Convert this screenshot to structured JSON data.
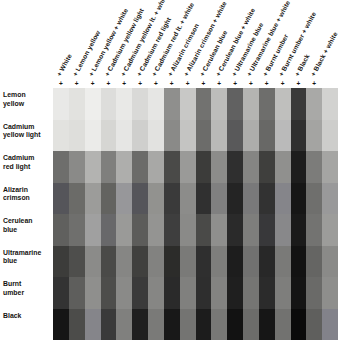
{
  "chart_data": {
    "type": "heatmap",
    "title": "",
    "xlabel": "",
    "ylabel": "",
    "grid": false,
    "legend": "none",
    "columns": [
      "+ White",
      "+ Lemon yellow",
      "+ Lemon yellow + white",
      "+ Cadmium yellow light",
      "+ Cadmium yellow lt. + white",
      "+ Cadmium red light",
      "+ Cadmium red lt. + white",
      "+ Alizarin crimson",
      "+ Alizarin crimson + white",
      "+ Cerulean blue",
      "+ Cerulean blue + white",
      "+ Ultramarine blue",
      "+ Ultramarine blue + white",
      "+ Burnt umber",
      "+ Burnt umber + white",
      "+ Black",
      "+ Black + white"
    ],
    "column_headers_full": [
      "+ White",
      "+ Lemon yellow",
      "+ Lemon yellow + white",
      "+ Cadmium yellow light",
      "+ Cadmium yellow lt. + white",
      "+ Cadmium red light",
      "+ Cadmium red lt. + white",
      "+ Alizarin crimson",
      "+ Alizarin crimson + white",
      "+ Cerulean blue",
      "+ Cerulean blue + white",
      "+ Ultramarine blue",
      "+ Ultramarine blue + white",
      "+ Burnt umber",
      "+ Burnt umber + white",
      "+ Black",
      "+ Black + white"
    ],
    "rows": [
      "Lemon yellow",
      "Cadmium yellow light",
      "Cadmium red light",
      "Alizarin crimson",
      "Cerulean blue",
      "Ultramarine blue",
      "Burnt umber",
      "Black"
    ],
    "row_labels_lines": [
      [
        "Lemon",
        "yellow"
      ],
      [
        "Cadmium",
        "yellow light"
      ],
      [
        "Cadmium",
        "red light"
      ],
      [
        "Alizarin",
        "crimson"
      ],
      [
        "Cerulean",
        "blue"
      ],
      [
        "Ultramarine",
        "blue"
      ],
      [
        "Burnt",
        "umber"
      ],
      [
        "Black"
      ]
    ],
    "n_rows": 8,
    "n_cols": 18,
    "swatch_colors": [
      [
        "#e9e9e7",
        "#e2e2df",
        "#eeeeec",
        "#dddddb",
        "#e9e9e7",
        "#d9d9d7",
        "#e6e6e4",
        "#8f8f8d",
        "#c8c8c6",
        "#727270",
        "#bdbdbb",
        "#616161",
        "#b4b4b2",
        "#6e6e6c",
        "#bfbfbd",
        "#3a3a3a",
        "#a9a9a7",
        "#d2d2d0"
      ],
      [
        "#e2e2df",
        "#dededb",
        "#ebebe9",
        "#d6d6d3",
        "#e6e6e4",
        "#cfcfcd",
        "#e2e2e0",
        "#8a8a88",
        "#c4c4c2",
        "#6c6c6a",
        "#b9b9b7",
        "#59595a",
        "#adadab",
        "#686866",
        "#bababa",
        "#303030",
        "#a4a4a2",
        "#cdcdcb"
      ],
      [
        "#6e6e6c",
        "#8a8a88",
        "#b3b3b1",
        "#7f7f7d",
        "#aeaeac",
        "#6b6b69",
        "#a8a8a6",
        "#4a4a48",
        "#9a9a98",
        "#3c3c3a",
        "#8c8c8a",
        "#2f2f2f",
        "#858583",
        "#3f3f3d",
        "#90908e",
        "#1d1d1d",
        "#7c7c7a",
        "#a5a5a3"
      ],
      [
        "#55555a",
        "#6b6b68",
        "#9c9c9a",
        "#636360",
        "#97979a",
        "#55555a",
        "#92928f",
        "#3a3a3a",
        "#8c8c8a",
        "#303030",
        "#808080",
        "#242424",
        "#79797a",
        "#323232",
        "#85858a",
        "#161616",
        "#6f6f6d",
        "#99999a"
      ],
      [
        "#60605e",
        "#6f6f6d",
        "#a0a0a0",
        "#68686a",
        "#9a9a98",
        "#5c5c5a",
        "#949492",
        "#3e3e3e",
        "#8a8a88",
        "#4a4a48",
        "#8f8f8d",
        "#2a2a2a",
        "#7e7e7c",
        "#38383a",
        "#88888a",
        "#1a1a1a",
        "#737371",
        "#9c9c9a"
      ],
      [
        "#3c3c3a",
        "#4e4e4c",
        "#8b8b89",
        "#4a4a48",
        "#868684",
        "#40403e",
        "#828280",
        "#2c2c2a",
        "#7a7a78",
        "#2f2f2f",
        "#7e7e7c",
        "#1d1d1d",
        "#717170",
        "#282828",
        "#7a7a78",
        "#121212",
        "#656563",
        "#8a8a88"
      ],
      [
        "#333333",
        "#5e5e5c",
        "#8f8f8d",
        "#4d4d4b",
        "#8a8a88",
        "#3a3a3a",
        "#868684",
        "#2a2a2a",
        "#80807e",
        "#2e2e2e",
        "#838381",
        "#1f1f1f",
        "#757573",
        "#2b2b2b",
        "#7e7e7c",
        "#141414",
        "#6a6a68",
        "#8e8e8c"
      ],
      [
        "#151515",
        "#4c4c4a",
        "#85858a",
        "#3a3a3a",
        "#80807e",
        "#1f1f1f",
        "#7a7a78",
        "#181818",
        "#747472",
        "#1c1c1c",
        "#787876",
        "#121212",
        "#6c6c6a",
        "#161616",
        "#727270",
        "#0a0a0a",
        "#5f5f5d",
        "#82828a"
      ]
    ]
  },
  "background": "#ffffff"
}
